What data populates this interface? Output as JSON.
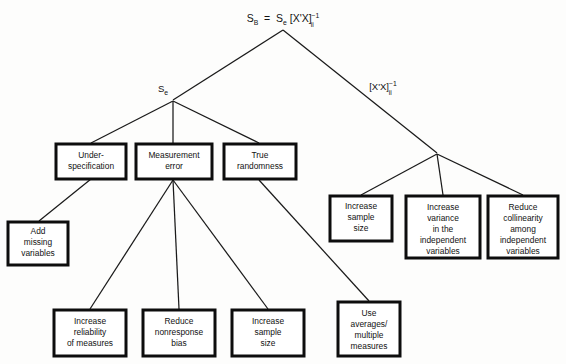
{
  "diagram": {
    "type": "tree",
    "title_formula": {
      "base_left": "S",
      "sub_left": "B",
      "equals": "=",
      "base_right": "S",
      "sub_right": "e",
      "bracket": "[X'X]",
      "exponent": "−1",
      "subscript_ii": "ii",
      "full_text": "S_B = S_e [X'X]^-1_ii"
    },
    "branch_labels": [
      {
        "id": "branch-se",
        "text": "S",
        "subscript": "e",
        "x": 163,
        "y": 92
      },
      {
        "id": "branch-xx",
        "bracket": "[X'X]",
        "exponent": "−1",
        "subscript": "ii",
        "x": 383,
        "y": 90
      }
    ],
    "nodes": [
      {
        "id": "under-specification",
        "lines": [
          "Under-",
          "specification"
        ],
        "x": 56,
        "y": 144,
        "w": 70,
        "h": 35
      },
      {
        "id": "measurement-error",
        "lines": [
          "Measurement",
          "error"
        ],
        "x": 136,
        "y": 144,
        "w": 76,
        "h": 35
      },
      {
        "id": "true-randomness",
        "lines": [
          "True",
          "randomness"
        ],
        "x": 224,
        "y": 144,
        "w": 72,
        "h": 35
      },
      {
        "id": "add-missing-variables",
        "lines": [
          "Add",
          "missing",
          "variables"
        ],
        "x": 8,
        "y": 222,
        "w": 60,
        "h": 43
      },
      {
        "id": "increase-sample-size-right",
        "lines": [
          "Increase",
          "sample",
          "size"
        ],
        "x": 330,
        "y": 196,
        "w": 62,
        "h": 45
      },
      {
        "id": "increase-variance-independent",
        "lines": [
          "Increase",
          "variance",
          "in the",
          "independent",
          "variables"
        ],
        "x": 406,
        "y": 196,
        "w": 74,
        "h": 62
      },
      {
        "id": "reduce-collinearity",
        "lines": [
          "Reduce",
          "collinearity",
          "among",
          "independent",
          "variables"
        ],
        "x": 488,
        "y": 196,
        "w": 70,
        "h": 62
      },
      {
        "id": "increase-reliability",
        "lines": [
          "Increase",
          "reliability",
          "of measures"
        ],
        "x": 54,
        "y": 310,
        "w": 72,
        "h": 46
      },
      {
        "id": "reduce-nonresponse-bias",
        "lines": [
          "Reduce",
          "nonresponse",
          "bias"
        ],
        "x": 143,
        "y": 310,
        "w": 72,
        "h": 46
      },
      {
        "id": "increase-sample-size-bottom",
        "lines": [
          "Increase",
          "sample",
          "size"
        ],
        "x": 232,
        "y": 310,
        "w": 72,
        "h": 46
      },
      {
        "id": "use-averages-multiple-measures",
        "lines": [
          "Use",
          "averages/",
          "multiple",
          "measures"
        ],
        "x": 338,
        "y": 302,
        "w": 62,
        "h": 54
      }
    ],
    "edges": [
      {
        "id": "root-to-se",
        "from": "root",
        "to": "branch-se",
        "points": "283,30 173,100"
      },
      {
        "id": "root-to-xx",
        "from": "root",
        "to": "branch-xx",
        "points": "283,30 437,153"
      },
      {
        "id": "se-to-under",
        "from": "branch-se",
        "to": "under-specification",
        "points": "173,101 91,143"
      },
      {
        "id": "se-to-measurement",
        "from": "branch-se",
        "to": "measurement-error",
        "points": "173,101 173,143"
      },
      {
        "id": "se-to-true",
        "from": "branch-se",
        "to": "true-randomness",
        "points": "173,101 259,143"
      },
      {
        "id": "under-to-add-missing",
        "from": "under-specification",
        "to": "add-missing-variables",
        "points": "91,179 39,221"
      },
      {
        "id": "measurement-to-reliability",
        "from": "measurement-error",
        "to": "increase-reliability",
        "points": "173,180 90,309"
      },
      {
        "id": "measurement-to-nonresponse",
        "from": "measurement-error",
        "to": "reduce-nonresponse-bias",
        "points": "173,180 179,309"
      },
      {
        "id": "measurement-to-sample",
        "from": "measurement-error",
        "to": "increase-sample-size-bottom",
        "points": "173,180 268,309"
      },
      {
        "id": "true-to-averages",
        "from": "true-randomness",
        "to": "use-averages-multiple-measures",
        "points": "259,180 369,301"
      },
      {
        "id": "xx-to-sample",
        "from": "branch-xx",
        "to": "increase-sample-size-right",
        "points": "437,154 361,195"
      },
      {
        "id": "xx-to-variance",
        "from": "branch-xx",
        "to": "increase-variance-independent",
        "points": "437,154 443,195"
      },
      {
        "id": "xx-to-collinearity",
        "from": "branch-xx",
        "to": "reduce-collinearity",
        "points": "437,154 523,195"
      }
    ],
    "colors": {
      "background": "#fdfdfc",
      "box_border": "#0d0d0d",
      "box_fill": "#ffffff",
      "line": "#1a1a1a",
      "text": "#121212"
    }
  }
}
